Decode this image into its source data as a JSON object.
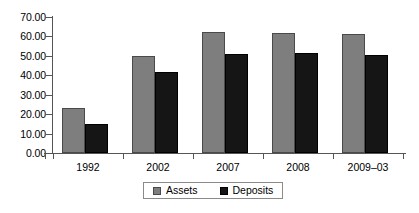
{
  "chart_data": {
    "type": "bar",
    "title": "",
    "subtitle": "",
    "xlabel": "",
    "ylabel": "",
    "categories": [
      "1992",
      "2002",
      "2007",
      "2008",
      "2009–03"
    ],
    "series": [
      {
        "name": "Assets",
        "color": "#7e7e7e",
        "values": [
          23.0,
          50.0,
          62.5,
          62.0,
          61.0
        ]
      },
      {
        "name": "Deposits",
        "color": "#151515",
        "values": [
          15.0,
          41.5,
          51.0,
          51.5,
          50.5
        ]
      }
    ],
    "ylim": [
      0,
      70
    ],
    "ytick_step": 10,
    "ytick_labels": [
      "70.00",
      "60.00",
      "50.00",
      "40.00",
      "30.00",
      "20.00",
      "10.00",
      "0.00"
    ],
    "ytick_values": [
      70,
      60,
      50,
      40,
      30,
      20,
      10,
      0
    ],
    "grid": false,
    "legend_position": "bottom",
    "legend_entries": [
      "Assets",
      "Deposits"
    ]
  }
}
